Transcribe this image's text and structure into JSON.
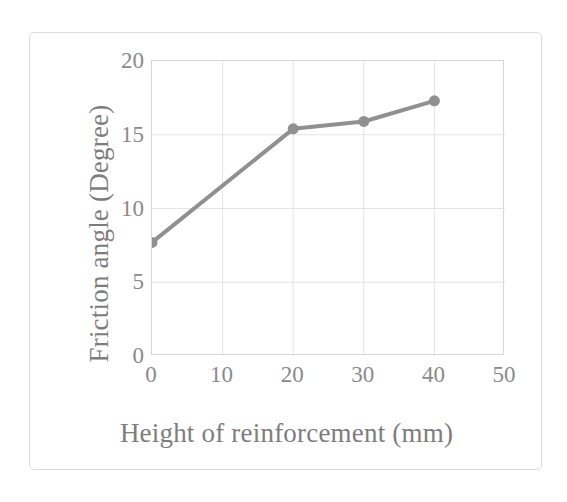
{
  "figure": {
    "background_color": "#ffffff",
    "frame_color": "#dcdcdc",
    "axis_color": "#d6d6d6",
    "gridline_color": "#e3e3e3",
    "series_color": "#909090",
    "label_color": "#8a8a8a",
    "title_color": "#7d7d7d"
  },
  "chart_data": {
    "type": "line",
    "title": "",
    "xlabel": "Height of reinforcement (mm)",
    "ylabel": "Friction angle (Degree)",
    "xlim": [
      0,
      50
    ],
    "ylim": [
      0,
      20
    ],
    "xticks": [
      0,
      10,
      20,
      30,
      40,
      50
    ],
    "yticks": [
      0,
      5,
      10,
      15,
      20
    ],
    "xtick_labels": [
      "0",
      "10",
      "20",
      "30",
      "40",
      "50"
    ],
    "ytick_labels": [
      "0",
      "5",
      "10",
      "15",
      "20"
    ],
    "grid": true,
    "legend": false,
    "legend_position": "none",
    "marker": "circle",
    "marker_size": 11,
    "line_width": 4,
    "series": [
      {
        "name": "Friction angle",
        "color": "#909090",
        "x": [
          0,
          20,
          30,
          40
        ],
        "y": [
          7.7,
          15.4,
          15.9,
          17.3
        ],
        "points": [
          {
            "x": 0,
            "y": 7.7
          },
          {
            "x": 20,
            "y": 15.4
          },
          {
            "x": 30,
            "y": 15.9
          },
          {
            "x": 40,
            "y": 17.3
          }
        ]
      }
    ]
  }
}
